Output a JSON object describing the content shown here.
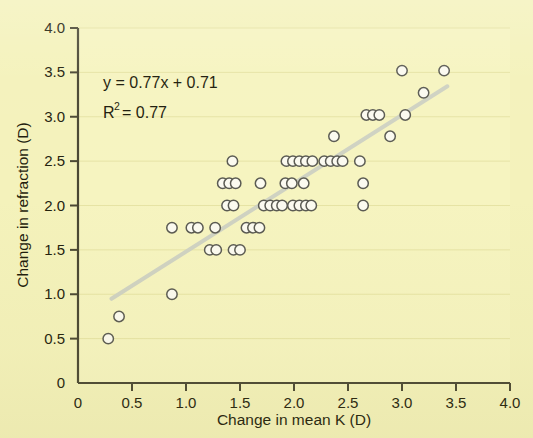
{
  "figure": {
    "background_color": "#f4f2bb",
    "plot_background_color": "#f6f4c0"
  },
  "chart_data": {
    "type": "scatter",
    "title": "",
    "xlabel": "Change in mean K (D)",
    "ylabel": "Change in refraction (D)",
    "xlim": [
      0,
      4.0
    ],
    "ylim": [
      0,
      4.0
    ],
    "xticks": [
      "0",
      "0.5",
      "1.0",
      "1.5",
      "2.0",
      "2.5",
      "3.0",
      "3.5",
      "4.0"
    ],
    "yticks": [
      "0",
      "0.5",
      "1.0",
      "1.5",
      "2.0",
      "2.5",
      "3.0",
      "3.5",
      "4.0"
    ],
    "xtick_values": [
      0,
      0.5,
      1.0,
      1.5,
      2.0,
      2.5,
      3.0,
      3.5,
      4.0
    ],
    "ytick_values": [
      0,
      0.5,
      1.0,
      1.5,
      2.0,
      2.5,
      3.0,
      3.5,
      4.0
    ],
    "grid": "horizontal-faint",
    "legend": "none",
    "marker": {
      "shape": "circle-open",
      "edge_color": "#5a5a52",
      "fill_color": "#fbfaf0",
      "radius_px": 5.2
    },
    "trendline": {
      "equation": "y = 0.77x + 0.71",
      "slope": 0.77,
      "intercept": 0.71,
      "r_squared": 0.77,
      "color": "#cfd2c2",
      "width_px": 4,
      "x_start": 0.31,
      "x_end": 3.42
    },
    "annotations": [
      {
        "text": "y = 0.77x + 0.71",
        "x": 0.4,
        "y": 3.44
      },
      {
        "text": "R2 = 0.77",
        "x": 0.4,
        "y": 3.1
      }
    ],
    "points": [
      [
        0.28,
        0.5
      ],
      [
        0.38,
        0.75
      ],
      [
        0.87,
        1.0
      ],
      [
        0.87,
        1.75
      ],
      [
        1.05,
        1.75
      ],
      [
        1.11,
        1.75
      ],
      [
        1.27,
        1.75
      ],
      [
        1.56,
        1.75
      ],
      [
        1.62,
        1.75
      ],
      [
        1.68,
        1.75
      ],
      [
        1.22,
        1.5
      ],
      [
        1.28,
        1.5
      ],
      [
        1.44,
        1.5
      ],
      [
        1.5,
        1.5
      ],
      [
        1.38,
        2.0
      ],
      [
        1.44,
        2.0
      ],
      [
        1.72,
        2.0
      ],
      [
        1.78,
        2.0
      ],
      [
        1.84,
        2.0
      ],
      [
        1.89,
        2.0
      ],
      [
        1.99,
        2.0
      ],
      [
        2.05,
        2.0
      ],
      [
        2.11,
        2.0
      ],
      [
        2.16,
        2.0
      ],
      [
        2.64,
        2.0
      ],
      [
        1.34,
        2.25
      ],
      [
        1.4,
        2.25
      ],
      [
        1.46,
        2.25
      ],
      [
        1.69,
        2.25
      ],
      [
        1.92,
        2.25
      ],
      [
        1.98,
        2.25
      ],
      [
        2.09,
        2.25
      ],
      [
        2.64,
        2.25
      ],
      [
        1.43,
        2.5
      ],
      [
        1.93,
        2.5
      ],
      [
        1.99,
        2.5
      ],
      [
        2.05,
        2.5
      ],
      [
        2.11,
        2.5
      ],
      [
        2.17,
        2.5
      ],
      [
        2.28,
        2.5
      ],
      [
        2.34,
        2.5
      ],
      [
        2.4,
        2.5
      ],
      [
        2.45,
        2.5
      ],
      [
        2.61,
        2.5
      ],
      [
        2.37,
        2.78
      ],
      [
        2.89,
        2.78
      ],
      [
        2.67,
        3.02
      ],
      [
        2.73,
        3.02
      ],
      [
        2.79,
        3.02
      ],
      [
        3.03,
        3.02
      ],
      [
        3.2,
        3.27
      ],
      [
        3.0,
        3.52
      ],
      [
        3.39,
        3.52
      ]
    ]
  }
}
